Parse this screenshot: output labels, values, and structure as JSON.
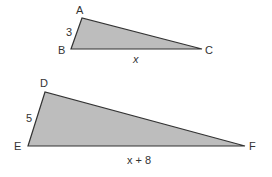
{
  "diagram": {
    "fill_color": "#bdbdbd",
    "stroke_color": "#333333",
    "triangles": [
      {
        "name": "ABC",
        "vertices": {
          "A": {
            "label": "A",
            "x": 82,
            "y": 18
          },
          "B": {
            "label": "B",
            "x": 71,
            "y": 49
          },
          "C": {
            "label": "C",
            "x": 202,
            "y": 49
          }
        },
        "side_labels": {
          "AB": "3",
          "BC": "x"
        }
      },
      {
        "name": "DEF",
        "vertices": {
          "D": {
            "label": "D",
            "x": 45,
            "y": 92
          },
          "E": {
            "label": "E",
            "x": 28,
            "y": 146
          },
          "F": {
            "label": "F",
            "x": 245,
            "y": 146
          }
        },
        "side_labels": {
          "DE": "5",
          "EF": "x + 8"
        }
      }
    ]
  }
}
